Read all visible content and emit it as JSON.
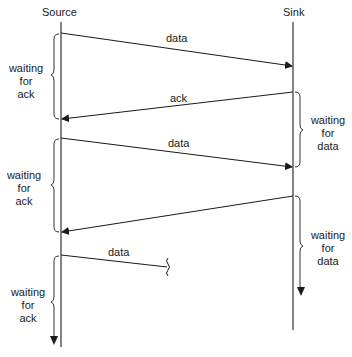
{
  "diagram": {
    "type": "sequence",
    "participants": {
      "source": "Source",
      "sink": "Sink"
    },
    "messages": [
      {
        "from": "Source",
        "to": "Sink",
        "label": "data"
      },
      {
        "from": "Sink",
        "to": "Source",
        "label": "ack"
      },
      {
        "from": "Source",
        "to": "Sink",
        "label": "data"
      },
      {
        "from": "Sink",
        "to": "Source",
        "label": ""
      },
      {
        "from": "Source",
        "to": "Sink",
        "label": "data",
        "truncated": true
      }
    ],
    "source_waits": [
      {
        "line1": "waiting",
        "line2": "for",
        "line3": "ack"
      },
      {
        "line1": "waiting",
        "line2": "for",
        "line3": "ack"
      },
      {
        "line1": "waiting",
        "line2": "for",
        "line3": "ack"
      }
    ],
    "sink_waits": [
      {
        "line1": "waiting",
        "line2": "for",
        "line3": "data"
      },
      {
        "line1": "waiting",
        "line2": "for",
        "line3": "data"
      }
    ]
  }
}
